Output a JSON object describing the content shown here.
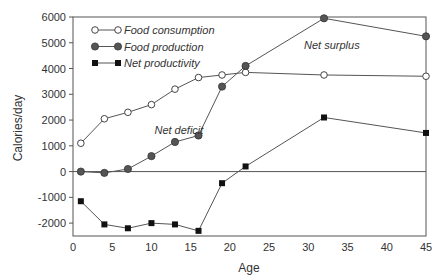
{
  "chart_data": {
    "type": "line",
    "title": "",
    "xlabel": "Age",
    "ylabel": "Calories/day",
    "xlim": [
      0,
      45
    ],
    "ylim": [
      -2500,
      6000
    ],
    "x_ticks": [
      0,
      5,
      10,
      15,
      20,
      25,
      30,
      35,
      40,
      45
    ],
    "y_ticks": [
      -2000,
      -1000,
      0,
      1000,
      2000,
      3000,
      4000,
      5000,
      6000
    ],
    "grid": false,
    "legend_position": "upper left",
    "series": [
      {
        "name": "Food consumption",
        "marker": "open-circle",
        "x": [
          1,
          4,
          7,
          10,
          13,
          16,
          19,
          22,
          32,
          45
        ],
        "values": [
          1100,
          2050,
          2300,
          2600,
          3200,
          3650,
          3750,
          3850,
          3750,
          3700
        ]
      },
      {
        "name": "Food production",
        "marker": "filled-circle",
        "x": [
          1,
          4,
          7,
          10,
          13,
          16,
          19,
          22,
          32,
          45
        ],
        "values": [
          0,
          -50,
          100,
          600,
          1150,
          1400,
          3300,
          4100,
          5950,
          5250
        ]
      },
      {
        "name": "Net productivity",
        "marker": "filled-square",
        "x": [
          1,
          4,
          7,
          10,
          13,
          16,
          19,
          22,
          32,
          45
        ],
        "values": [
          -1150,
          -2050,
          -2200,
          -2000,
          -2050,
          -2300,
          -450,
          200,
          2100,
          1500
        ]
      }
    ],
    "annotations": [
      {
        "text": "Net deficit",
        "x": 13.5,
        "y": 1450
      },
      {
        "text": "Net surplus",
        "x": 33,
        "y": 4750
      }
    ]
  }
}
